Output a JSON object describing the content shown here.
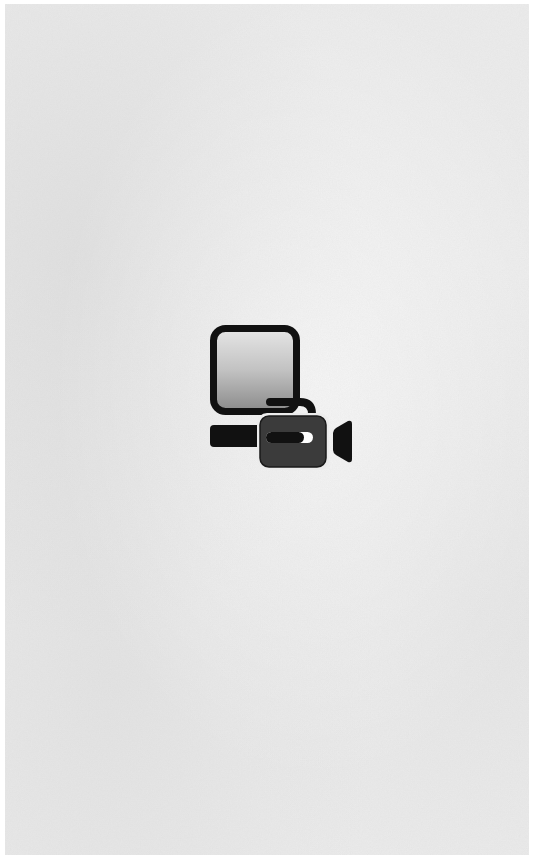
{
  "page": {
    "background_color": "#ececec",
    "border_color": "#ffffff"
  },
  "icon": {
    "name": "computer-video-camera-icon",
    "description": "monitor with video camera",
    "colors": {
      "outline": "#111111",
      "screen_top": "#e4e4e4",
      "screen_bottom": "#8e8e8e",
      "camera_body": "#3b3b3b",
      "highlight": "#ffffff"
    }
  }
}
